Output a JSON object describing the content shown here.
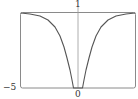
{
  "chart_data": {
    "type": "line",
    "title": "",
    "xlabel": "",
    "ylabel": "",
    "ylim": [
      -5,
      1
    ],
    "y_ticks": [
      "1",
      "-5"
    ],
    "x_ticks": [
      "0"
    ],
    "grid": false,
    "legend": null,
    "series": [
      {
        "name": "f(x)",
        "description": "symmetric curve approaching 1 at both ends, plunging to -5 near x = 0",
        "points_pixel": [
          [
            21,
            13
          ],
          [
            30,
            14
          ],
          [
            40,
            16
          ],
          [
            48,
            20
          ],
          [
            55,
            27
          ],
          [
            60,
            36
          ],
          [
            64,
            47
          ],
          [
            67,
            58
          ],
          [
            70,
            70
          ],
          [
            72,
            80
          ],
          [
            73.5,
            88
          ],
          [
            82.5,
            88
          ],
          [
            84,
            80
          ],
          [
            86,
            70
          ],
          [
            89,
            58
          ],
          [
            92,
            47
          ],
          [
            96,
            36
          ],
          [
            101,
            27
          ],
          [
            108,
            20
          ],
          [
            116,
            16
          ],
          [
            126,
            14
          ],
          [
            135,
            13
          ]
        ]
      }
    ],
    "labels": {
      "top": "1",
      "bottom_left": "−5",
      "bottom_center": "0"
    },
    "colors": {
      "frame": "#8a8a8a",
      "curve": "#555555",
      "axis": "#9a9a9a"
    }
  }
}
